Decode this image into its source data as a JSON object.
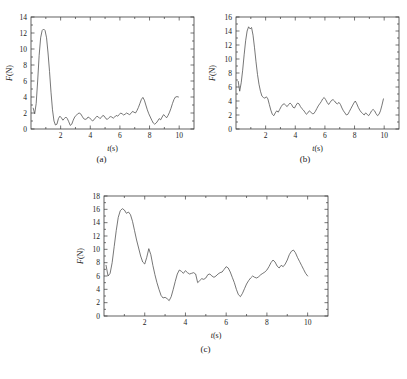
{
  "figure": {
    "background": "#ffffff",
    "line_color": "#4a4a4a",
    "axis_color": "#3a3a3a"
  },
  "panels": [
    {
      "caption": "(a)",
      "xlabel_var": "t",
      "xlabel_unit": "(s)",
      "ylabel_var": "F",
      "ylabel_unit": "(N)"
    },
    {
      "caption": "(b)",
      "xlabel_var": "t",
      "xlabel_unit": "(s)",
      "ylabel_var": "F",
      "ylabel_unit": "(N)"
    },
    {
      "caption": "(c)",
      "xlabel_var": "t",
      "xlabel_unit": "(s)",
      "ylabel_var": "F",
      "ylabel_unit": "(N)"
    }
  ],
  "chart_data": [
    {
      "type": "line",
      "panel": "(a)",
      "title": "",
      "xlabel": "t(s)",
      "ylabel": "F(N)",
      "xlim": [
        0,
        11
      ],
      "ylim": [
        0,
        14
      ],
      "xticks": [
        2,
        4,
        6,
        8,
        10
      ],
      "xtick_labels": [
        "2",
        "4",
        "6",
        "8",
        "10"
      ],
      "yticks": [
        0,
        2,
        4,
        6,
        8,
        10,
        12,
        14
      ],
      "ytick_labels": [
        "0",
        "2",
        "4",
        "6",
        "8",
        "10",
        "12",
        "14"
      ],
      "minor_xticks": [
        1,
        3,
        5,
        7,
        9
      ],
      "minor_yticks": [
        1,
        3,
        5,
        7,
        9,
        11,
        13
      ],
      "grid": false,
      "legend": false,
      "x": [
        0.15,
        0.25,
        0.35,
        0.45,
        0.55,
        0.65,
        0.75,
        0.85,
        0.95,
        1.05,
        1.15,
        1.25,
        1.35,
        1.45,
        1.55,
        1.65,
        1.75,
        1.85,
        1.95,
        2.05,
        2.15,
        2.25,
        2.35,
        2.45,
        2.55,
        2.65,
        2.75,
        2.85,
        2.95,
        3.05,
        3.15,
        3.25,
        3.35,
        3.45,
        3.55,
        3.65,
        3.75,
        3.85,
        3.95,
        4.05,
        4.15,
        4.25,
        4.35,
        4.45,
        4.55,
        4.65,
        4.75,
        4.85,
        4.95,
        5.05,
        5.15,
        5.25,
        5.35,
        5.45,
        5.55,
        5.65,
        5.75,
        5.85,
        5.95,
        6.05,
        6.15,
        6.25,
        6.35,
        6.45,
        6.55,
        6.65,
        6.75,
        6.85,
        6.95,
        7.05,
        7.15,
        7.25,
        7.35,
        7.45,
        7.55,
        7.65,
        7.75,
        7.85,
        7.95,
        8.05,
        8.15,
        8.25,
        8.35,
        8.45,
        8.55,
        8.65,
        8.75,
        8.85,
        8.95,
        9.05,
        9.15,
        9.25,
        9.35,
        9.45,
        9.55,
        9.65,
        9.75,
        9.85,
        9.95
      ],
      "y": [
        2.6,
        1.9,
        3.2,
        6.0,
        9.2,
        11.4,
        12.3,
        12.5,
        12.3,
        11.4,
        9.5,
        7.2,
        4.6,
        2.4,
        1.0,
        0.5,
        0.6,
        1.3,
        1.6,
        1.4,
        1.1,
        1.3,
        1.5,
        1.3,
        0.9,
        0.45,
        0.6,
        1.1,
        1.5,
        1.7,
        1.9,
        2.0,
        1.9,
        1.6,
        1.3,
        1.2,
        1.25,
        1.5,
        1.4,
        1.2,
        1.0,
        1.15,
        1.4,
        1.6,
        1.5,
        1.3,
        1.45,
        1.7,
        1.6,
        1.3,
        1.2,
        1.4,
        1.55,
        1.5,
        1.35,
        1.5,
        1.7,
        1.6,
        1.8,
        2.0,
        1.9,
        1.75,
        1.85,
        2.0,
        1.9,
        1.8,
        1.95,
        2.2,
        2.1,
        2.0,
        2.3,
        2.7,
        3.2,
        3.7,
        3.95,
        3.6,
        3.0,
        2.4,
        1.9,
        1.5,
        1.1,
        0.75,
        0.6,
        0.75,
        1.0,
        1.3,
        1.15,
        1.5,
        1.8,
        1.6,
        1.4,
        1.7,
        2.1,
        2.6,
        3.2,
        3.7,
        4.0,
        4.05,
        4.0
      ]
    },
    {
      "type": "line",
      "panel": "(b)",
      "title": "",
      "xlabel": "t(s)",
      "ylabel": "F(N)",
      "xlim": [
        0,
        11
      ],
      "ylim": [
        0,
        16
      ],
      "xticks": [
        2,
        4,
        6,
        8,
        10
      ],
      "xtick_labels": [
        "2",
        "4",
        "6",
        "8",
        "10"
      ],
      "yticks": [
        0,
        2,
        4,
        6,
        8,
        10,
        12,
        14,
        16
      ],
      "ytick_labels": [
        "0",
        "2",
        "4",
        "6",
        "8",
        "10",
        "12",
        "14",
        "16"
      ],
      "minor_xticks": [
        1,
        3,
        5,
        7,
        9
      ],
      "minor_yticks": [
        1,
        3,
        5,
        7,
        9,
        11,
        13,
        15
      ],
      "grid": false,
      "legend": false,
      "x": [
        0.15,
        0.25,
        0.35,
        0.45,
        0.55,
        0.65,
        0.75,
        0.85,
        0.95,
        1.05,
        1.15,
        1.25,
        1.35,
        1.45,
        1.55,
        1.65,
        1.75,
        1.85,
        1.95,
        2.05,
        2.15,
        2.25,
        2.35,
        2.45,
        2.55,
        2.65,
        2.75,
        2.85,
        2.95,
        3.05,
        3.15,
        3.25,
        3.35,
        3.45,
        3.55,
        3.65,
        3.75,
        3.85,
        3.95,
        4.05,
        4.15,
        4.25,
        4.35,
        4.45,
        4.55,
        4.65,
        4.75,
        4.85,
        4.95,
        5.05,
        5.15,
        5.25,
        5.35,
        5.45,
        5.55,
        5.65,
        5.75,
        5.85,
        5.95,
        6.05,
        6.15,
        6.25,
        6.35,
        6.45,
        6.55,
        6.65,
        6.75,
        6.85,
        6.95,
        7.05,
        7.15,
        7.25,
        7.35,
        7.45,
        7.55,
        7.65,
        7.75,
        7.85,
        7.95,
        8.05,
        8.15,
        8.25,
        8.35,
        8.45,
        8.55,
        8.65,
        8.75,
        8.85,
        8.95,
        9.05,
        9.15,
        9.25,
        9.35,
        9.45,
        9.55,
        9.65,
        9.75,
        9.85,
        9.95
      ],
      "y": [
        6.8,
        5.4,
        6.6,
        8.4,
        10.6,
        12.6,
        14.0,
        14.6,
        14.3,
        14.5,
        13.4,
        11.6,
        9.6,
        7.8,
        6.4,
        5.4,
        4.7,
        4.5,
        4.4,
        4.6,
        4.3,
        3.5,
        2.7,
        2.1,
        1.9,
        2.3,
        2.6,
        2.4,
        2.8,
        3.2,
        3.5,
        3.6,
        3.4,
        3.2,
        3.5,
        3.7,
        3.5,
        3.1,
        3.0,
        3.4,
        3.7,
        3.6,
        3.2,
        2.9,
        2.7,
        2.4,
        2.1,
        2.3,
        2.6,
        2.4,
        2.2,
        2.2,
        2.5,
        2.9,
        3.3,
        3.6,
        3.9,
        4.3,
        4.5,
        4.2,
        3.8,
        3.5,
        3.8,
        4.1,
        4.2,
        4.0,
        3.7,
        3.6,
        3.8,
        3.5,
        3.0,
        2.6,
        2.3,
        2.0,
        2.1,
        2.5,
        2.9,
        3.3,
        3.7,
        4.0,
        3.6,
        3.1,
        2.7,
        2.4,
        2.2,
        2.0,
        2.3,
        2.1,
        1.9,
        2.2,
        2.6,
        2.8,
        2.6,
        2.2,
        1.9,
        2.1,
        2.6,
        3.4,
        4.3,
        4.8
      ]
    },
    {
      "type": "line",
      "panel": "(c)",
      "title": "",
      "xlabel": "t(s)",
      "ylabel": "F(N)",
      "xlim": [
        0,
        11
      ],
      "ylim": [
        0,
        18
      ],
      "xticks": [
        2,
        4,
        6,
        8,
        10
      ],
      "xtick_labels": [
        "2",
        "4",
        "6",
        "8",
        "10"
      ],
      "yticks": [
        0,
        2,
        4,
        6,
        8,
        10,
        12,
        14,
        16,
        18
      ],
      "ytick_labels": [
        "0",
        "2",
        "4",
        "6",
        "8",
        "10",
        "12",
        "14",
        "16",
        "18"
      ],
      "minor_xticks": [
        1,
        3,
        5,
        7,
        9
      ],
      "minor_yticks": [
        1,
        3,
        5,
        7,
        9,
        11,
        13,
        15,
        17
      ],
      "grid": false,
      "legend": false,
      "x": [
        0.1,
        0.2,
        0.3,
        0.4,
        0.5,
        0.6,
        0.7,
        0.8,
        0.9,
        1.0,
        1.1,
        1.2,
        1.3,
        1.4,
        1.5,
        1.6,
        1.7,
        1.8,
        1.9,
        2.0,
        2.1,
        2.2,
        2.3,
        2.4,
        2.5,
        2.6,
        2.7,
        2.8,
        2.9,
        3.0,
        3.1,
        3.2,
        3.3,
        3.4,
        3.5,
        3.6,
        3.7,
        3.8,
        3.9,
        4.0,
        4.1,
        4.2,
        4.3,
        4.4,
        4.5,
        4.6,
        4.7,
        4.8,
        4.9,
        5.0,
        5.1,
        5.2,
        5.3,
        5.4,
        5.5,
        5.6,
        5.7,
        5.8,
        5.9,
        6.0,
        6.1,
        6.2,
        6.3,
        6.4,
        6.5,
        6.6,
        6.7,
        6.8,
        6.9,
        7.0,
        7.1,
        7.2,
        7.3,
        7.4,
        7.5,
        7.6,
        7.7,
        7.8,
        7.9,
        8.0,
        8.1,
        8.2,
        8.3,
        8.4,
        8.5,
        8.6,
        8.7,
        8.8,
        8.9,
        9.0,
        9.1,
        9.2,
        9.3,
        9.4,
        9.5,
        9.6,
        9.7,
        9.8,
        9.9,
        10.0
      ],
      "y": [
        7.6,
        6.0,
        6.4,
        8.0,
        10.4,
        12.8,
        14.8,
        15.8,
        16.1,
        15.9,
        15.4,
        15.6,
        15.2,
        14.2,
        12.8,
        11.4,
        10.2,
        9.0,
        8.1,
        7.8,
        8.8,
        10.1,
        9.2,
        7.6,
        6.2,
        5.0,
        4.0,
        3.1,
        2.7,
        2.8,
        2.6,
        2.3,
        2.9,
        4.0,
        5.2,
        6.3,
        6.9,
        6.7,
        6.4,
        6.8,
        6.5,
        6.3,
        6.4,
        6.5,
        6.3,
        5.0,
        5.3,
        5.6,
        5.5,
        5.7,
        6.2,
        6.3,
        6.0,
        5.8,
        6.0,
        6.3,
        6.5,
        6.6,
        7.0,
        7.4,
        7.2,
        6.6,
        5.8,
        5.0,
        4.0,
        3.2,
        2.9,
        3.4,
        4.1,
        4.8,
        5.3,
        5.7,
        6.0,
        5.8,
        5.7,
        5.9,
        6.2,
        6.4,
        6.6,
        6.9,
        7.4,
        8.0,
        8.4,
        8.1,
        7.5,
        7.2,
        7.6,
        7.4,
        7.8,
        8.4,
        9.2,
        9.7,
        9.9,
        9.5,
        8.8,
        8.2,
        7.6,
        7.0,
        6.4,
        6.0
      ]
    }
  ]
}
